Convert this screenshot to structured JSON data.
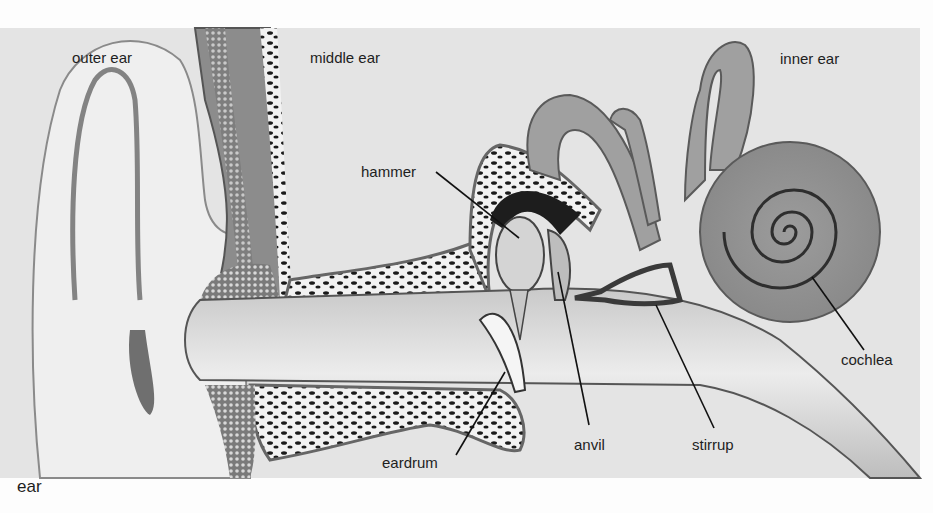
{
  "figure": {
    "caption": "ear",
    "colors": {
      "background": "#fdfdfd",
      "panel": "#e6e6e6",
      "skin": "#eeeeee",
      "tissue": "#9a9a9a",
      "bone_dark": "#1a1a1a",
      "line": "#111111"
    }
  },
  "regions": {
    "outer": "outer ear",
    "middle": "middle ear",
    "inner": "inner ear"
  },
  "parts": {
    "hammer": "hammer",
    "eardrum": "eardrum",
    "anvil": "anvil",
    "stirrup": "stirrup",
    "cochlea": "cochlea"
  }
}
